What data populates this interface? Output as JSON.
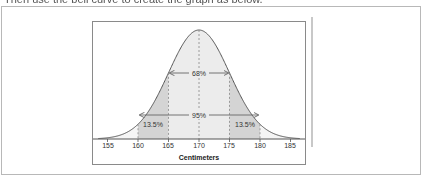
{
  "caption": "Then use the bell curve to create the graph as below.",
  "chart_data": {
    "type": "area",
    "title": "",
    "subtitle": "",
    "xlabel": "Centimeters",
    "ylabel": "",
    "x_ticks": [
      155,
      160,
      165,
      170,
      175,
      180,
      185
    ],
    "x_tick_labels": [
      "155",
      "160",
      "165",
      "170",
      "175",
      "180",
      "185"
    ],
    "xlim": [
      153,
      187
    ],
    "distribution": {
      "kind": "normal",
      "mean": 170,
      "sd": 5
    },
    "grid": false,
    "legend": null,
    "shaded_regions": [
      {
        "from": 160,
        "to": 165,
        "label": "13.5%",
        "shade": "dark"
      },
      {
        "from": 165,
        "to": 175,
        "label": "",
        "shade": "light"
      },
      {
        "from": 175,
        "to": 180,
        "label": "13.5%",
        "shade": "dark"
      }
    ],
    "annotations": [
      {
        "type": "arrow",
        "from": 165,
        "to": 175,
        "label": "68%"
      },
      {
        "type": "arrow",
        "from": 160,
        "to": 180,
        "label": "95%"
      },
      {
        "type": "dashed-line",
        "x": 170
      },
      {
        "type": "dashed-line",
        "x": 165
      },
      {
        "type": "dashed-line",
        "x": 175
      },
      {
        "type": "dashed-line",
        "x": 160
      },
      {
        "type": "dashed-line",
        "x": 180
      }
    ]
  },
  "labels": {
    "pct68": "68%",
    "pct95": "95%",
    "pct135_left": "13.5%",
    "pct135_right": "13.5%",
    "xlabel": "Centimeters",
    "ticks": [
      "155",
      "160",
      "165",
      "170",
      "175",
      "180",
      "185"
    ]
  },
  "colors": {
    "curve": "#555555",
    "dark_shade": "#d4d4d4",
    "light_shade": "#ececec",
    "arrow": "#666666"
  }
}
